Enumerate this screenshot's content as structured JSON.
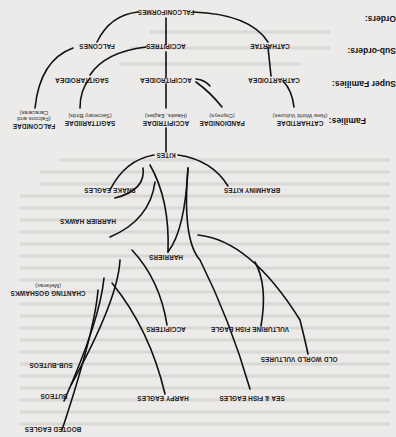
{
  "orientation": "rotated-180",
  "row_labels": {
    "orders": "Orders:",
    "sub_orders": "Sub-orders:",
    "super_families": "Super Families:",
    "families": "Families:"
  },
  "order": {
    "name": "FALCONIFORMES"
  },
  "sub_orders": [
    {
      "name": "FALCONES"
    },
    {
      "name": "ACCIPITRES"
    },
    {
      "name": "CATHARTAE"
    }
  ],
  "super_families": [
    {
      "name": "SAGITTAROIDEA"
    },
    {
      "name": "ACCIPITROIDEA"
    },
    {
      "name": "CATHARTOIDEA"
    }
  ],
  "families": [
    {
      "name": "FALCONIDAE",
      "common": [
        "(Falcons and",
        "Caracaras)"
      ]
    },
    {
      "name": "SAGITTARIIDAE",
      "common": [
        "(Secretary Birds)"
      ]
    },
    {
      "name": "ACCIPITRIDAE",
      "common": [
        "(Hawks, Eagles)"
      ]
    },
    {
      "name": "PANDIONIDAE",
      "common": [
        "(Ospreys)"
      ]
    },
    {
      "name": "CATHARTIDAE",
      "common": [
        "(New World Vultures)"
      ]
    }
  ],
  "accipitridae_groups": {
    "root": "KITES",
    "groups": [
      "SNAKE EAGLES",
      "BRAHMINY KITES",
      "HARRIER HAWKS",
      "HARRIERS",
      "CHANTING GOSHAWKS",
      "ACCIPITERS",
      "VULTURINE FISH EAGLE",
      "OLD WORLD VULTURES",
      "SUB-BUTEOS",
      "BUTEOS",
      "HARPY EAGLES",
      "SEA & FISH EAGLES",
      "BOOTED EAGLES"
    ],
    "chanting_goshawks_genus": "(Melierax)"
  }
}
